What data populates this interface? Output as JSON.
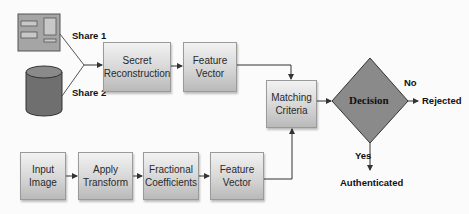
{
  "diagram": {
    "type": "flowchart",
    "sources": [
      {
        "id": "share1",
        "icon": "document-icon",
        "label": "Share 1"
      },
      {
        "id": "share2",
        "icon": "database-cylinder-icon",
        "label": "Share 2"
      }
    ],
    "top_row": [
      {
        "id": "secret_reconstruction",
        "label": "Secret Reconstruction"
      },
      {
        "id": "feature_vector_top",
        "label": "Feature Vector"
      }
    ],
    "bottom_row": [
      {
        "id": "input_image",
        "label": "Input Image"
      },
      {
        "id": "apply_transform",
        "label": "Apply Transform"
      },
      {
        "id": "fractional_coefficients",
        "label": "Fractional Coefficients"
      },
      {
        "id": "feature_vector_bottom",
        "label": "Feature Vector"
      }
    ],
    "matching": {
      "id": "matching_criteria",
      "label": "Matching Criteria"
    },
    "decision": {
      "id": "decision",
      "label": "Decision"
    },
    "outcomes": {
      "no": {
        "branch_label": "No",
        "result": "Rejected"
      },
      "yes": {
        "branch_label": "Yes",
        "result": "Authenticated"
      }
    },
    "edges": [
      [
        "share1",
        "secret_reconstruction"
      ],
      [
        "share2",
        "secret_reconstruction"
      ],
      [
        "secret_reconstruction",
        "feature_vector_top"
      ],
      [
        "feature_vector_top",
        "matching_criteria"
      ],
      [
        "input_image",
        "apply_transform"
      ],
      [
        "apply_transform",
        "fractional_coefficients"
      ],
      [
        "fractional_coefficients",
        "feature_vector_bottom"
      ],
      [
        "feature_vector_bottom",
        "matching_criteria"
      ],
      [
        "matching_criteria",
        "decision"
      ],
      [
        "decision",
        "Rejected",
        "No"
      ],
      [
        "decision",
        "Authenticated",
        "Yes"
      ]
    ],
    "colors": {
      "box_fill_top": "#f2f2f2",
      "box_fill_bottom": "#b9b9b9",
      "decision_fill": "#8a8a8a",
      "icon_fill": "#8c8c8c",
      "line": "#555555"
    }
  }
}
